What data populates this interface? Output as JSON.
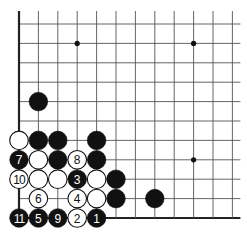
{
  "board": {
    "description": "Go problem diagram, lower-left corner",
    "columns_shown": 12,
    "rows_shown": 11,
    "edges": [
      "left",
      "bottom"
    ],
    "star_points": [
      [
        3,
        1
      ],
      [
        9,
        1
      ],
      [
        9,
        7
      ]
    ],
    "stones": [
      {
        "color": "black",
        "col": 1,
        "row": 4,
        "label": ""
      },
      {
        "color": "white",
        "col": 0,
        "row": 6,
        "label": ""
      },
      {
        "color": "black",
        "col": 1,
        "row": 6,
        "label": ""
      },
      {
        "color": "black",
        "col": 2,
        "row": 6,
        "label": ""
      },
      {
        "color": "black",
        "col": 4,
        "row": 6,
        "label": ""
      },
      {
        "color": "black",
        "col": 0,
        "row": 7,
        "label": "7"
      },
      {
        "color": "white",
        "col": 1,
        "row": 7,
        "label": ""
      },
      {
        "color": "black",
        "col": 2,
        "row": 7,
        "label": ""
      },
      {
        "color": "white",
        "col": 3,
        "row": 7,
        "label": "8"
      },
      {
        "color": "black",
        "col": 4,
        "row": 7,
        "label": ""
      },
      {
        "color": "white",
        "col": 0,
        "row": 8,
        "label": "10"
      },
      {
        "color": "white",
        "col": 1,
        "row": 8,
        "label": ""
      },
      {
        "color": "white",
        "col": 2,
        "row": 8,
        "label": ""
      },
      {
        "color": "black",
        "col": 3,
        "row": 8,
        "label": "3"
      },
      {
        "color": "white",
        "col": 4,
        "row": 8,
        "label": ""
      },
      {
        "color": "black",
        "col": 5,
        "row": 8,
        "label": ""
      },
      {
        "color": "white",
        "col": 1,
        "row": 9,
        "label": "6"
      },
      {
        "color": "white",
        "col": 3,
        "row": 9,
        "label": "4"
      },
      {
        "color": "white",
        "col": 4,
        "row": 9,
        "label": ""
      },
      {
        "color": "black",
        "col": 5,
        "row": 9,
        "label": ""
      },
      {
        "color": "black",
        "col": 7,
        "row": 9,
        "label": ""
      },
      {
        "color": "black",
        "col": 0,
        "row": 10,
        "label": "11"
      },
      {
        "color": "black",
        "col": 1,
        "row": 10,
        "label": "5"
      },
      {
        "color": "black",
        "col": 2,
        "row": 10,
        "label": "9"
      },
      {
        "color": "white",
        "col": 3,
        "row": 10,
        "label": "2"
      },
      {
        "color": "black",
        "col": 4,
        "row": 10,
        "label": "1"
      }
    ],
    "colors": {
      "black": "#111111",
      "white": "#ffffff",
      "line": "#555555",
      "edge": "#222222"
    }
  }
}
